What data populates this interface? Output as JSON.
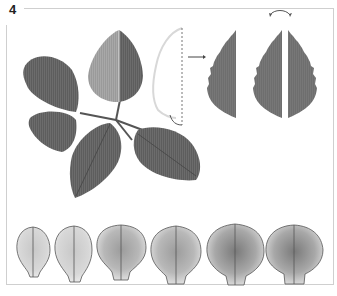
{
  "figure": {
    "step_number": "4",
    "colors": {
      "frame": "#cfcfcf",
      "leaf_dark": "#5a5a5a",
      "leaf_light": "#9a9a9a",
      "template_leaf": "#6e6e6e",
      "outline": "#d8d8d8",
      "petal_outline": "#555555"
    },
    "panels": [
      {
        "name": "rose-leaf-cluster",
        "description": "Photographed rose leaf with five leaflets; top leaflet half highlighted"
      },
      {
        "name": "leaf-outline-tracing",
        "description": "Half-leaf outline traced with dashed midrib line"
      },
      {
        "name": "leaf-template-half",
        "description": "Grey half-leaf template"
      },
      {
        "name": "leaf-template-mirrored",
        "description": "Two mirrored grey half-leaf templates with flip arc"
      },
      {
        "name": "petal-sequence",
        "description": "Six petal templates increasing in size",
        "count": 6
      }
    ]
  }
}
